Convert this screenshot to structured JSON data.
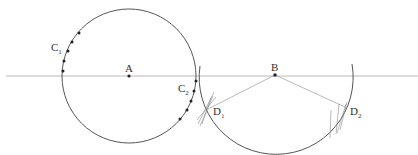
{
  "diagram": {
    "type": "geometric-construction",
    "colors": {
      "background": "#ffffff",
      "axis_line": "#b8b8b8",
      "circle": "#555555",
      "radius_lines": "#a8a8a8",
      "construction_marks": "#8a8a8a",
      "points": "#222222",
      "labels": "#333333"
    },
    "axis_line": {
      "x1": 6,
      "y1": 76,
      "x2": 418,
      "y2": 76
    },
    "circle_a": {
      "cx": 129,
      "cy": 76,
      "r": 67
    },
    "arc_b": {
      "cx": 276,
      "cy": 74,
      "r": 77
    },
    "points": {
      "A": {
        "label": "A",
        "x": 129,
        "y": 76
      },
      "B": {
        "label": "B",
        "x": 275,
        "y": 75
      }
    },
    "labels": {
      "A": "A",
      "B": "B",
      "C1": {
        "main": "C",
        "sub": "1"
      },
      "C2": {
        "main": "C",
        "sub": "2"
      },
      "D1": {
        "main": "D",
        "sub": "1"
      },
      "D2": {
        "main": "D",
        "sub": "2"
      }
    },
    "intersections": {
      "D1": {
        "x": 208,
        "y": 109
      },
      "D2": {
        "x": 345,
        "y": 107
      }
    },
    "c1_points": [
      {
        "x": 79,
        "y": 33
      },
      {
        "x": 72,
        "y": 42
      },
      {
        "x": 68,
        "y": 51
      },
      {
        "x": 64,
        "y": 61
      },
      {
        "x": 63,
        "y": 71
      }
    ],
    "c2_points": [
      {
        "x": 196,
        "y": 81
      },
      {
        "x": 194,
        "y": 91
      },
      {
        "x": 191,
        "y": 101
      },
      {
        "x": 187,
        "y": 110
      },
      {
        "x": 180,
        "y": 119
      }
    ]
  }
}
